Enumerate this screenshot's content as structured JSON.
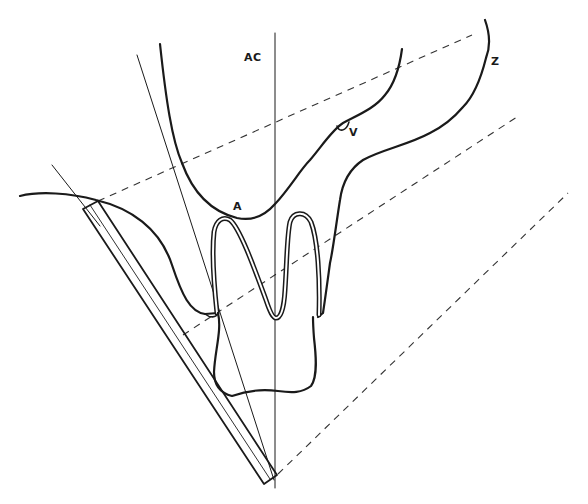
{
  "diagram": {
    "type": "dental radiograph bisecting-angle technique schematic",
    "labels": {
      "ac": "AC",
      "a": "A",
      "v": "V",
      "z": "Z"
    },
    "colors": {
      "ink": "#1a1a1a",
      "dash": "#333333",
      "background": "#ffffff"
    },
    "elements": [
      "long-axis line AC",
      "bisector line",
      "film plate",
      "tooth (crown and two roots)",
      "alveolar / sinus contour",
      "zygomatic contour Z",
      "projection rays (dashed)"
    ]
  }
}
